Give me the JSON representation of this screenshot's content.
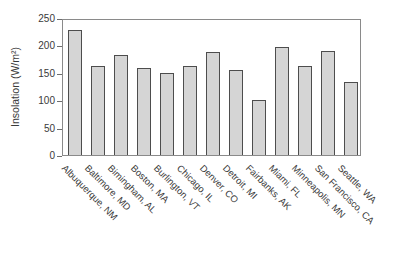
{
  "chart_data": {
    "type": "bar",
    "title": "",
    "xlabel": "",
    "ylabel": "Insolation (W/m²)",
    "ylim": [
      0,
      250
    ],
    "yticks": [
      0,
      50,
      100,
      150,
      200,
      250
    ],
    "grid": false,
    "legend_position": "none",
    "categories": [
      "Albuquerque, NM",
      "Baltimore, MD",
      "Bimingham, AL",
      "Boston, MA",
      "Burlington, VT",
      "Chicago, IL",
      "Denver, CO",
      "Detroit, MI",
      "Fairbanks, AK",
      "Miami, FL",
      "Minneapolis, MN",
      "San Francisco, CA",
      "Seattle, WA"
    ],
    "values": [
      232,
      165,
      185,
      162,
      152,
      164,
      190,
      158,
      102,
      200,
      165,
      192,
      135
    ],
    "colors": {
      "bar_fill": "#d5d5d5",
      "bar_border": "#4d4d4d",
      "frame": "#8a8a8a",
      "text": "#3a3a3a",
      "background": "#ffffff"
    }
  }
}
